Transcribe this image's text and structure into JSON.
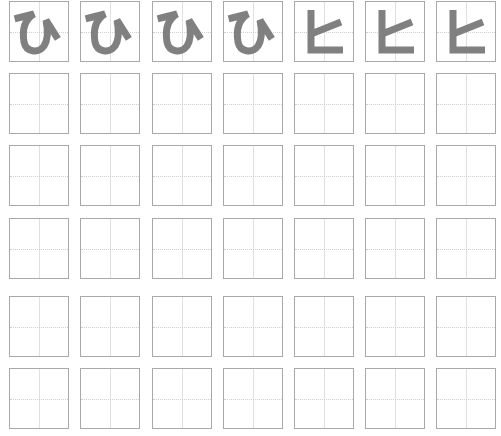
{
  "worksheet": {
    "columns": 7,
    "rows": 6,
    "column_x": [
      9,
      80,
      152,
      223,
      294,
      365,
      436
    ],
    "row_y": [
      1,
      73,
      145,
      218,
      296,
      368
    ],
    "colors": {
      "glyph": "#808080",
      "border": "#a9a9a9",
      "guide": "#cfcfcf"
    },
    "model_row": [
      {
        "char": "ひ",
        "script": "hiragana"
      },
      {
        "char": "ひ",
        "script": "hiragana"
      },
      {
        "char": "ひ",
        "script": "hiragana"
      },
      {
        "char": "ひ",
        "script": "hiragana"
      },
      {
        "char": "ヒ",
        "script": "katakana"
      },
      {
        "char": "ヒ",
        "script": "katakana"
      },
      {
        "char": "ヒ",
        "script": "katakana"
      }
    ],
    "practice_rows": 5
  }
}
